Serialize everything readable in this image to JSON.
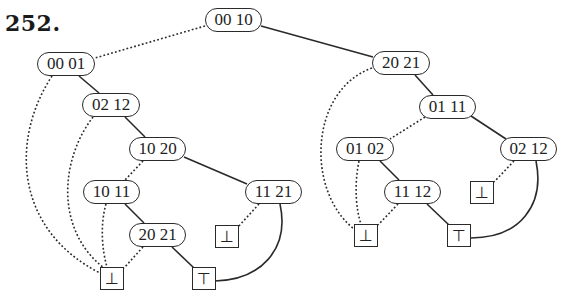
{
  "problem_number": "252.",
  "left_tree": {
    "nodes": [
      {
        "id": "n0010",
        "label": "00 10"
      },
      {
        "id": "n0001",
        "label": "00 01"
      },
      {
        "id": "n0212a",
        "label": "02 12"
      },
      {
        "id": "n1020",
        "label": "10 20"
      },
      {
        "id": "n1011",
        "label": "10 11"
      },
      {
        "id": "n2021a",
        "label": "20 21"
      },
      {
        "id": "n1121",
        "label": "11 21"
      }
    ],
    "leaves": [
      {
        "id": "bot_mid",
        "label": "⊥"
      },
      {
        "id": "bot_left",
        "label": "⊥"
      },
      {
        "id": "top_left",
        "label": "⊤"
      }
    ]
  },
  "right_tree": {
    "nodes": [
      {
        "id": "n2021b",
        "label": "20 21"
      },
      {
        "id": "n0111",
        "label": "01 11"
      },
      {
        "id": "n0102",
        "label": "01 02"
      },
      {
        "id": "n0212b",
        "label": "02 12"
      },
      {
        "id": "n1112",
        "label": "11 12"
      }
    ],
    "leaves": [
      {
        "id": "bot_right_small",
        "label": "⊥"
      },
      {
        "id": "bot_right",
        "label": "⊥"
      },
      {
        "id": "top_right",
        "label": "⊤"
      }
    ]
  },
  "edges": [
    {
      "from": "00 10",
      "to": "00 01",
      "style": "dotted"
    },
    {
      "from": "00 10",
      "to": "20 21 (right)",
      "style": "solid"
    },
    {
      "from": "00 01",
      "to": "⊥ (left)",
      "style": "dotted"
    },
    {
      "from": "00 01",
      "to": "02 12 (left)",
      "style": "solid"
    },
    {
      "from": "02 12 (left)",
      "to": "⊥ (left)",
      "style": "dotted"
    },
    {
      "from": "02 12 (left)",
      "to": "10 20",
      "style": "solid"
    },
    {
      "from": "10 20",
      "to": "10 11",
      "style": "dotted"
    },
    {
      "from": "10 20",
      "to": "11 21",
      "style": "solid"
    },
    {
      "from": "10 11",
      "to": "⊥ (left)",
      "style": "dotted"
    },
    {
      "from": "10 11",
      "to": "20 21 (left)",
      "style": "solid"
    },
    {
      "from": "20 21 (left)",
      "to": "⊥ (left)",
      "style": "dotted"
    },
    {
      "from": "20 21 (left)",
      "to": "⊤ (left)",
      "style": "solid"
    },
    {
      "from": "11 21",
      "to": "⊥ (small)",
      "style": "dotted"
    },
    {
      "from": "11 21",
      "to": "⊤ (left)",
      "style": "solid"
    },
    {
      "from": "20 21 (right)",
      "to": "⊥ (right)",
      "style": "dotted"
    },
    {
      "from": "20 21 (right)",
      "to": "01 11",
      "style": "solid"
    },
    {
      "from": "01 11",
      "to": "01 02",
      "style": "dotted"
    },
    {
      "from": "01 11",
      "to": "02 12 (right)",
      "style": "solid"
    },
    {
      "from": "01 02",
      "to": "⊥ (right)",
      "style": "dotted"
    },
    {
      "from": "01 02",
      "to": "11 12",
      "style": "solid"
    },
    {
      "from": "11 12",
      "to": "⊥ (right)",
      "style": "dotted"
    },
    {
      "from": "11 12",
      "to": "⊤ (right)",
      "style": "solid"
    },
    {
      "from": "02 12 (right)",
      "to": "⊥ (right small)",
      "style": "dotted"
    },
    {
      "from": "02 12 (right)",
      "to": "⊤ (right)",
      "style": "solid"
    }
  ]
}
